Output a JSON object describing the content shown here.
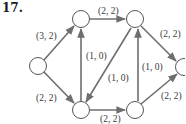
{
  "problem_number": "17.",
  "colors": {
    "edge": "#6e6e6e",
    "node_stroke": "#555555",
    "text": "#3a3a3a"
  },
  "nodes": [
    {
      "id": "s",
      "cx": 38,
      "cy": 66
    },
    {
      "id": "a",
      "cx": 81,
      "cy": 19
    },
    {
      "id": "b",
      "cx": 135,
      "cy": 19
    },
    {
      "id": "t",
      "cx": 184,
      "cy": 67
    },
    {
      "id": "c",
      "cx": 81,
      "cy": 110
    },
    {
      "id": "d",
      "cx": 135,
      "cy": 110
    }
  ],
  "edges": [
    {
      "from": "s",
      "to": "a",
      "label": "(3, 2)"
    },
    {
      "from": "s",
      "to": "c",
      "label": "(2, 2)"
    },
    {
      "from": "a",
      "to": "b",
      "label": "(2, 2)"
    },
    {
      "from": "c",
      "to": "a",
      "label": "(1, 0)"
    },
    {
      "from": "b",
      "to": "c",
      "label": "(1, 0)"
    },
    {
      "from": "c",
      "to": "d",
      "label": "(2, 2)"
    },
    {
      "from": "d",
      "to": "b",
      "label": "(1, 0)"
    },
    {
      "from": "b",
      "to": "t",
      "label": "(2, 2)"
    },
    {
      "from": "d",
      "to": "t",
      "label": "(2, 2)"
    }
  ]
}
